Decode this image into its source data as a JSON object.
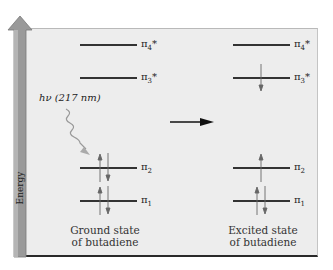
{
  "axis": {
    "label": "Energy"
  },
  "photon": {
    "label": "hν (217 nm)"
  },
  "ground_state": {
    "caption_line1": "Ground state",
    "caption_line2": "of butadiene",
    "orbitals": [
      {
        "name": "π4*",
        "symbol": "π",
        "sub": "4",
        "sup": "*",
        "electrons": "empty"
      },
      {
        "name": "π3*",
        "symbol": "π",
        "sub": "3",
        "sup": "*",
        "electrons": "empty"
      },
      {
        "name": "π2",
        "symbol": "π",
        "sub": "2",
        "sup": "",
        "electrons": "up-down pair"
      },
      {
        "name": "π1",
        "symbol": "π",
        "sub": "1",
        "sup": "",
        "electrons": "up-down pair"
      }
    ]
  },
  "excited_state": {
    "caption_line1": "Excited state",
    "caption_line2": "of butadiene",
    "orbitals": [
      {
        "name": "π4*",
        "symbol": "π",
        "sub": "4",
        "sup": "*",
        "electrons": "empty"
      },
      {
        "name": "π3*",
        "symbol": "π",
        "sub": "3",
        "sup": "*",
        "electrons": "one down"
      },
      {
        "name": "π2",
        "symbol": "π",
        "sub": "2",
        "sup": "",
        "electrons": "one up"
      },
      {
        "name": "π1",
        "symbol": "π",
        "sub": "1",
        "sup": "",
        "electrons": "up-down pair"
      }
    ]
  },
  "colors": {
    "panel": "#ededed",
    "energy_arrow": "#9a9a9a",
    "lines": "#333333",
    "photon_arrow": "#aaaaaa"
  }
}
